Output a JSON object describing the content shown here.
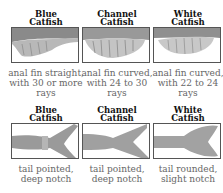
{
  "rows": [
    {
      "feature": "anal-fin",
      "items": [
        {
          "title_line1": "Blue",
          "title_line2": "Catfish",
          "caption": "anal fin straight, with 30 or more rays"
        },
        {
          "title_line1": "Channel",
          "title_line2": "Catfish",
          "caption": "anal fin curved, with 24 to 30 rays"
        },
        {
          "title_line1": "White",
          "title_line2": "Catfish",
          "caption": "anal fin curved, with 22 to 24 rays"
        }
      ]
    },
    {
      "feature": "tail",
      "items": [
        {
          "title_line1": "Blue",
          "title_line2": "Catfish",
          "caption": "tail pointed, deep notch"
        },
        {
          "title_line1": "Channel",
          "title_line2": "Catfish",
          "caption": "tail pointed, deep notch"
        },
        {
          "title_line1": "White",
          "title_line2": "Catfish",
          "caption": "tail rounded, slight notch"
        }
      ]
    }
  ]
}
